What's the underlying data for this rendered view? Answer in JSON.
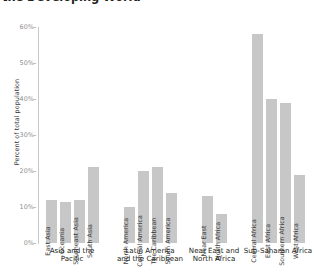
{
  "title": "the Developing World",
  "chart_data": {
    "type": "bar",
    "title": "the Developing World",
    "xlabel": "",
    "ylabel": "Percent of total population",
    "ylim": [
      0,
      60
    ],
    "ytick_labels": [
      "0%",
      "10%",
      "20%",
      "30%",
      "40%",
      "50%",
      "60%"
    ],
    "ytick_values": [
      0,
      10,
      20,
      30,
      40,
      50,
      60
    ],
    "grid": false,
    "legend": "none",
    "bar_color": "#c7c7c7",
    "groups": [
      {
        "label": "Asia and the\nPacific",
        "label_line1": "Asia and the",
        "label_line2": "Pacific",
        "categories": [
          "East Asia",
          "Oceania",
          "Southeast Asia",
          "South Asia"
        ],
        "values": [
          12,
          11.5,
          12,
          21
        ]
      },
      {
        "label": "Latin America\nand the Caribbean",
        "label_line1": "Latin America",
        "label_line2": "and the Caribbean",
        "categories": [
          "North America",
          "Central America",
          "The Caribbean",
          "South America"
        ],
        "values": [
          10,
          20,
          21,
          14
        ]
      },
      {
        "label": "Near East and\nNorth Africa",
        "label_line1": "Near East and",
        "label_line2": "North Africa",
        "categories": [
          "Near East",
          "North Africa"
        ],
        "values": [
          13,
          8
        ]
      },
      {
        "label": "Sub-Saharan Africa",
        "label_line1": "Sub-Saharan Africa",
        "label_line2": "",
        "categories": [
          "Central Africa",
          "East Africa",
          "Southern Africa",
          "West Africa"
        ],
        "values": [
          58,
          40,
          39,
          19
        ]
      }
    ]
  }
}
